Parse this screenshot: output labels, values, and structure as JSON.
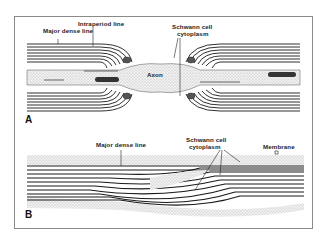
{
  "figure": {
    "panels": [
      {
        "id": "A",
        "label": "A",
        "labels": {
          "major_dense_line": "Major dense line",
          "intraperiod_line": "Intraperiod line",
          "schwann_line1": "Schwann cell",
          "schwann_line2": "cytoplasm",
          "axon": "Axon"
        }
      },
      {
        "id": "B",
        "label": "B",
        "labels": {
          "major_dense_line": "Major dense line",
          "schwann_line1": "Schwann cell",
          "schwann_line2": "cytoplasm",
          "membrane": "Membrane"
        }
      }
    ],
    "colors": {
      "ink": "#1a1a1a",
      "stipple": "#c8c8c8",
      "frame": "#8a8a8a"
    }
  }
}
